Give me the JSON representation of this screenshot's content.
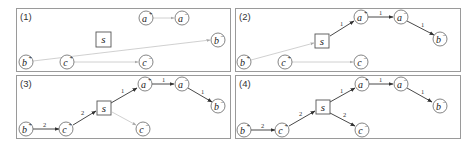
{
  "figure": {
    "panels": [
      {
        "label": "(1)",
        "nodes": {
          "a_plus": "a",
          "a_minus": "a",
          "b_plus": "b",
          "b_minus": "b",
          "c_plus": "c",
          "c_minus": "c",
          "s": "s"
        },
        "edges": [
          {
            "from": "a+",
            "to": "a-",
            "style": "faint",
            "label": ""
          },
          {
            "from": "b+",
            "to": "b-",
            "style": "faint",
            "label": ""
          },
          {
            "from": "c+",
            "to": "c-",
            "style": "faint",
            "label": ""
          }
        ]
      },
      {
        "label": "(2)",
        "edges": [
          {
            "from": "b+",
            "to": "s",
            "style": "faint",
            "label": ""
          },
          {
            "from": "s",
            "to": "a+",
            "style": "solid",
            "label": "1"
          },
          {
            "from": "a+",
            "to": "a-",
            "style": "solid",
            "label": "1"
          },
          {
            "from": "a-",
            "to": "b-",
            "style": "solid",
            "label": "1"
          },
          {
            "from": "c+",
            "to": "c-",
            "style": "faint",
            "label": ""
          }
        ]
      },
      {
        "label": "(3)",
        "edges": [
          {
            "from": "b+",
            "to": "c+",
            "style": "solid",
            "label": "2"
          },
          {
            "from": "c+",
            "to": "s",
            "style": "solid",
            "label": "2"
          },
          {
            "from": "s",
            "to": "a+",
            "style": "solid",
            "label": "1"
          },
          {
            "from": "a+",
            "to": "a-",
            "style": "solid",
            "label": "1"
          },
          {
            "from": "a-",
            "to": "b-",
            "style": "solid",
            "label": "1"
          },
          {
            "from": "s",
            "to": "c-",
            "style": "faint",
            "label": ""
          }
        ]
      },
      {
        "label": "(4)",
        "edges": [
          {
            "from": "b+",
            "to": "c+",
            "style": "solid",
            "label": "2"
          },
          {
            "from": "c+",
            "to": "s",
            "style": "solid",
            "label": "2"
          },
          {
            "from": "s",
            "to": "a+",
            "style": "solid",
            "label": "1"
          },
          {
            "from": "a+",
            "to": "a-",
            "style": "solid",
            "label": "1"
          },
          {
            "from": "a-",
            "to": "b-",
            "style": "solid",
            "label": "1"
          },
          {
            "from": "s",
            "to": "c-",
            "style": "solid",
            "label": "2"
          }
        ]
      }
    ],
    "node_letters": {
      "a": "a",
      "b": "b",
      "c": "c",
      "s": "s"
    },
    "signs": {
      "plus": "+",
      "minus": "−"
    },
    "edge_labels": {
      "one": "1",
      "two": "2"
    },
    "colors": {
      "border": "#9a9a9a",
      "solid_edge": "#333333",
      "faint_edge": "#c4c4c4"
    }
  }
}
